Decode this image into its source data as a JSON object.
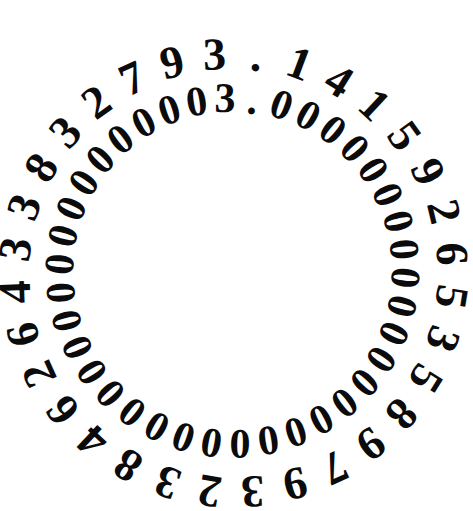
{
  "artwork": {
    "title": "Pi circular digit ring",
    "background_color": "#ffffff",
    "text_color": "#0b0b0b",
    "width": 457,
    "height": 480
  },
  "rings": [
    {
      "name": "outer-ring",
      "label": "pi-digits",
      "text": "3.141592653589793238462643383279",
      "radius": 196,
      "center_x": 222,
      "center_y": 250,
      "start_angle_deg": -2,
      "sweep_deg": 360,
      "font_size": 46,
      "direction": "clockwise"
    },
    {
      "name": "inner-ring",
      "label": "three-point-zero-digits",
      "text": "3.000000000000000000000000000000000000",
      "radius": 152,
      "center_x": 222,
      "center_y": 250,
      "start_angle_deg": 1,
      "sweep_deg": 360,
      "font_size": 42,
      "direction": "clockwise"
    }
  ],
  "readings": {
    "outer_label": "3.141592653589793238462643383279",
    "inner_label": "3.00000000000000000000000000000",
    "outer_meaning": "pi",
    "inner_meaning": "three"
  }
}
